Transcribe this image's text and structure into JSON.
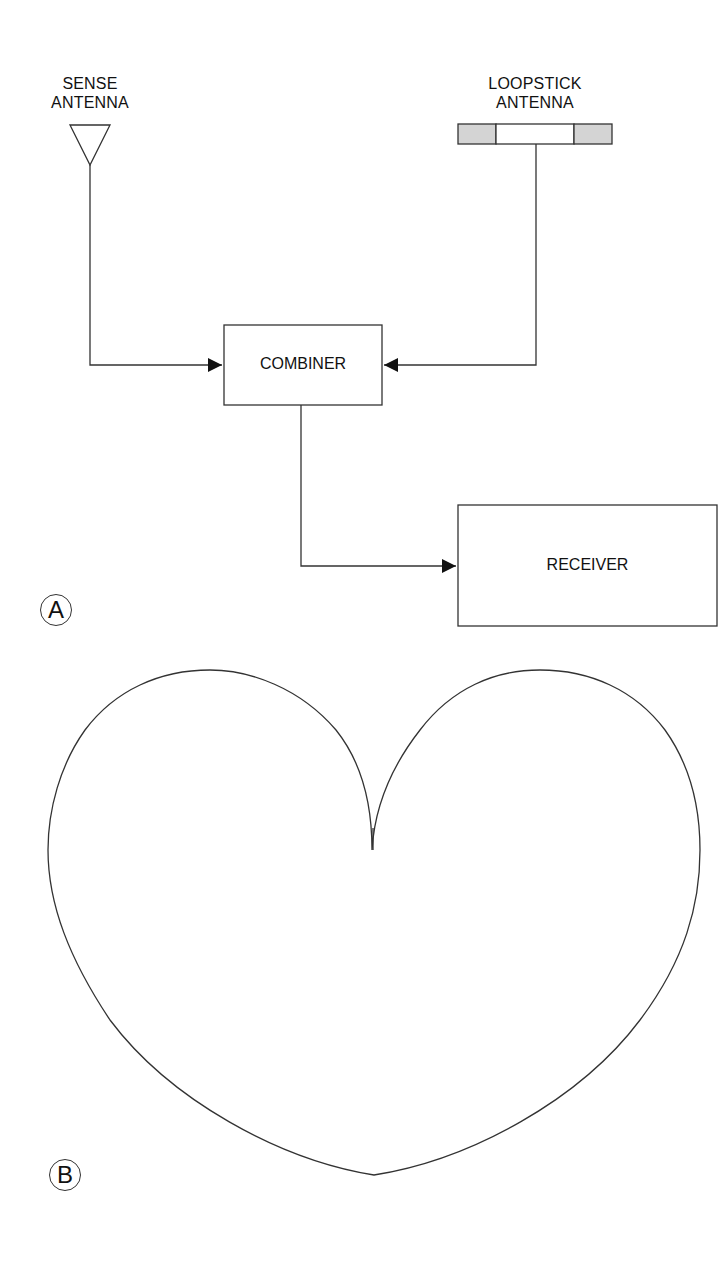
{
  "figure": {
    "part_a": {
      "label": "A",
      "sense_antenna": {
        "label_line1": "SENSE",
        "label_line2": "ANTENNA",
        "icon": "antenna-triangle-icon"
      },
      "loopstick_antenna": {
        "label_line1": "LOOPSTICK",
        "label_line2": "ANTENNA",
        "icon": "loopstick-bar-icon"
      },
      "combiner": {
        "label": "COMBINER"
      },
      "receiver": {
        "label": "RECEIVER"
      },
      "connections": [
        {
          "from": "SENSE ANTENNA",
          "to": "COMBINER"
        },
        {
          "from": "LOOPSTICK ANTENNA",
          "to": "COMBINER"
        },
        {
          "from": "COMBINER",
          "to": "RECEIVER"
        }
      ]
    },
    "part_b": {
      "label": "B",
      "pattern": "cardioid"
    },
    "colors": {
      "line": "#333333",
      "shade": "#d4d4d4",
      "background": "#ffffff"
    }
  }
}
